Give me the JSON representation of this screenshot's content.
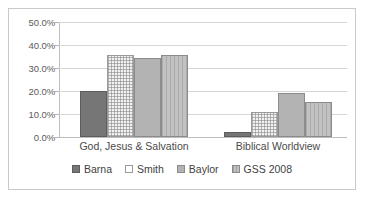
{
  "chart_data": {
    "type": "bar",
    "title": "",
    "subtitle": "",
    "xlabel": "",
    "ylabel": "",
    "categories": [
      "God, Jesus & Salvation",
      "Biblical Worldview"
    ],
    "series": [
      {
        "name": "Barna",
        "values": [
          20.0,
          2.0
        ],
        "color": "#767676"
      },
      {
        "name": "Smith",
        "values": [
          35.5,
          11.0
        ],
        "color": "#f1f1f1"
      },
      {
        "name": "Baylor",
        "values": [
          34.2,
          19.0
        ],
        "color": "#b3b3b3"
      },
      {
        "name": "GSS 2008",
        "values": [
          35.5,
          15.2
        ],
        "color": "#c2c2c2"
      }
    ],
    "ylim": [
      0,
      50
    ],
    "ytick_values": [
      0,
      10,
      20,
      30,
      40,
      50
    ],
    "ytick_labels": [
      "0.0%",
      "10.0%",
      "20.0%",
      "30.0%",
      "40.0%",
      "50.0%"
    ],
    "grid": true,
    "legend_position": "bottom",
    "value_format": "percent"
  }
}
